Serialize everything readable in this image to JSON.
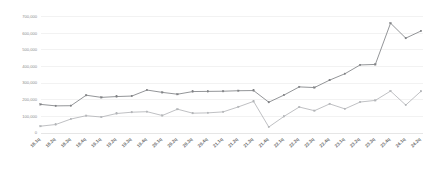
{
  "chart_data": {
    "type": "line",
    "title": "",
    "subtitle": "",
    "xlabel": "",
    "ylabel": "",
    "grid": true,
    "legend": "none",
    "ylim": [
      0,
      700000
    ],
    "ytick_values": [
      0,
      100000,
      200000,
      300000,
      400000,
      500000,
      600000,
      700000
    ],
    "ytick_labels": [
      "0",
      "100,000",
      "200,000",
      "300,000",
      "400,000",
      "500,000",
      "600,000",
      "700,000"
    ],
    "categories": [
      "18.1q",
      "18.2q",
      "18.3q",
      "18.4q",
      "19.1q",
      "19.2q",
      "19.3q",
      "19.4q",
      "20.1q",
      "20.2q",
      "20.3q",
      "20.4q",
      "21.1q",
      "21.2q",
      "21.3q",
      "21.4q",
      "22.1q",
      "22.2q",
      "22.3q",
      "22.4q",
      "23.1q",
      "23.2q",
      "23.3q",
      "23.4q",
      "24.1q",
      "24.2q"
    ],
    "series": [
      {
        "name": "series-upper",
        "color": "#808285",
        "marker": "square",
        "values": [
          172000,
          163000,
          164000,
          227000,
          214000,
          219000,
          222000,
          258000,
          244000,
          233000,
          249000,
          250000,
          251000,
          254000,
          255000,
          185000,
          228000,
          277000,
          273000,
          318000,
          356000,
          409000,
          412000,
          660000,
          570000,
          613000
        ]
      },
      {
        "name": "series-lower",
        "color": "#b3b5b8",
        "marker": "square",
        "values": [
          41000,
          51000,
          84000,
          104000,
          96000,
          117000,
          125000,
          128000,
          105000,
          143000,
          119000,
          121000,
          127000,
          157000,
          190000,
          36000,
          100000,
          156000,
          134000,
          175000,
          145000,
          186000,
          196000,
          252000,
          168000,
          251000
        ]
      }
    ]
  },
  "axis": {
    "ytitle": "",
    "xtitle": ""
  }
}
